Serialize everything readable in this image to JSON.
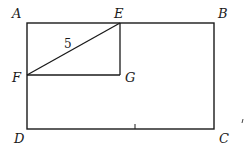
{
  "figure": {
    "points": {
      "A": "A",
      "B": "B",
      "C": "C",
      "D": "D",
      "E": "E",
      "F": "F",
      "G": "G"
    },
    "segment_label_EF": "5",
    "stroke_color": "#1a1a1a"
  }
}
